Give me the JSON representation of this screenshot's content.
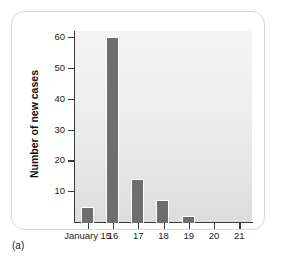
{
  "figure": {
    "caption": "(a)"
  },
  "chart_data": {
    "type": "bar",
    "title": "",
    "xlabel": "January",
    "ylabel": "Number of new cases",
    "categories": [
      "January 15",
      "16",
      "17",
      "18",
      "19",
      "20",
      "21"
    ],
    "values": [
      5,
      60,
      14,
      7,
      2,
      0,
      0
    ],
    "ylim": [
      0,
      62
    ],
    "yticks": [
      10,
      20,
      30,
      40,
      50,
      60
    ],
    "ytick_labels": [
      "10",
      "20",
      "30",
      "40",
      "50",
      "60"
    ],
    "xtick_labels": [
      "January 15",
      "16",
      "17",
      "18",
      "19",
      "20",
      "21"
    ],
    "grid": false,
    "legend": false,
    "bar_color": "#6e6e6e",
    "bar_edge_color": "#ffffff",
    "plot_background": "#ededed",
    "panel_background": "#ffffff",
    "axis_color": "#3a3a3a"
  }
}
